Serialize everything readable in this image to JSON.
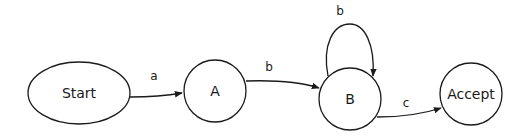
{
  "diagram": {
    "type": "state-machine",
    "nodes": [
      {
        "id": "start",
        "label": "Start",
        "shape": "ellipse"
      },
      {
        "id": "a",
        "label": "A",
        "shape": "circle"
      },
      {
        "id": "b",
        "label": "B",
        "shape": "circle"
      },
      {
        "id": "accept",
        "label": "Accept",
        "shape": "circle"
      }
    ],
    "edges": [
      {
        "from": "Start",
        "to": "A",
        "label": "a"
      },
      {
        "from": "A",
        "to": "B",
        "label": "b"
      },
      {
        "from": "B",
        "to": "B",
        "label": "b"
      },
      {
        "from": "B",
        "to": "Accept",
        "label": "c"
      }
    ],
    "colors": {
      "stroke": "#1a1a1a",
      "fill": "#ffffff",
      "background": "#ffffff"
    }
  }
}
